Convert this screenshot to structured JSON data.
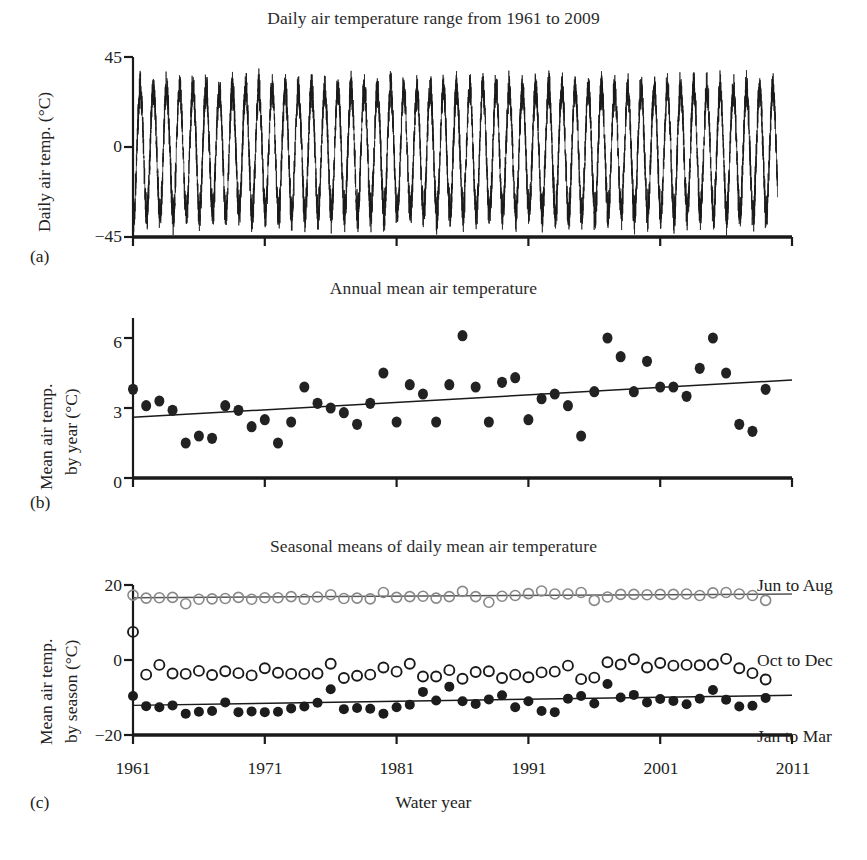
{
  "figure": {
    "panels": [
      {
        "letter": "(a)",
        "title": "Daily air temperature range from 1961 to 2009"
      },
      {
        "letter": "(b)",
        "title": "Annual mean air temperature"
      },
      {
        "letter": "(c)",
        "title": "Seasonal means of daily mean air temperature"
      }
    ],
    "xaxis_title": "Water year",
    "ink_color": "#1a1a1a"
  },
  "chart_data": [
    {
      "panel": "a",
      "type": "line",
      "title": "Daily air temperature range from 1961 to 2009",
      "xlabel": "",
      "ylabel": "Daily air temp. (°C)",
      "ylim": [
        -45,
        45
      ],
      "yticks": [
        45,
        0,
        -45
      ],
      "ytick_labels": [
        "45",
        "0",
        "−45"
      ],
      "xlim": [
        1961,
        2011
      ],
      "xticks": [
        1961,
        1971,
        1981,
        1991,
        2001,
        2011
      ],
      "grid": false,
      "legend": "none",
      "description": "Dense daily time series with strong annual sinusoidal cycle; summer peaks near +30 to +38 °C, winter troughs near −35 to −44 °C, around 49 annual cycles from 1961 to 2009.",
      "seasonal_cycle": {
        "mean": -1.0,
        "summer_peak_mean": 30,
        "summer_peak_max": 38,
        "winter_trough_mean": -32,
        "winter_trough_min": -44,
        "daily_noise_amplitude": 7,
        "cycles": 49
      }
    },
    {
      "panel": "b",
      "type": "scatter",
      "title": "Annual mean air temperature",
      "xlabel": "",
      "ylabel": "Mean air temp. by year (°C)",
      "ylim": [
        0,
        6.8
      ],
      "yticks": [
        6,
        3,
        0
      ],
      "ytick_labels": [
        "6",
        "3",
        "0"
      ],
      "xlim": [
        1961,
        2011
      ],
      "xticks": [
        1961,
        1971,
        1981,
        1991,
        2001,
        2011
      ],
      "grid": false,
      "legend": "none",
      "marker": "filled-circle",
      "x": [
        1961,
        1962,
        1963,
        1964,
        1965,
        1966,
        1967,
        1968,
        1969,
        1970,
        1971,
        1972,
        1973,
        1974,
        1975,
        1976,
        1977,
        1978,
        1979,
        1980,
        1981,
        1982,
        1983,
        1984,
        1985,
        1986,
        1987,
        1988,
        1989,
        1990,
        1991,
        1992,
        1993,
        1994,
        1995,
        1996,
        1997,
        1998,
        1999,
        2000,
        2001,
        2002,
        2003,
        2004,
        2005,
        2006,
        2007,
        2008,
        2009
      ],
      "values": [
        3.8,
        3.1,
        3.3,
        2.9,
        1.5,
        1.8,
        1.7,
        3.1,
        2.9,
        2.2,
        2.5,
        1.5,
        2.4,
        3.9,
        3.2,
        3.0,
        2.8,
        2.3,
        3.2,
        4.5,
        2.4,
        4.0,
        3.6,
        2.4,
        4.0,
        6.1,
        3.9,
        2.4,
        4.1,
        4.3,
        2.5,
        3.4,
        3.6,
        3.1,
        1.8,
        3.7,
        6.0,
        5.2,
        3.7,
        5.0,
        3.9,
        3.9,
        3.5,
        4.7,
        6.0,
        4.5,
        2.3,
        2.0,
        3.8
      ],
      "trend": {
        "type": "linear",
        "y_start": 2.6,
        "y_end": 4.2,
        "x_start": 1961,
        "x_end": 2011
      }
    },
    {
      "panel": "c",
      "type": "scatter",
      "title": "Seasonal means of daily mean air temperature",
      "xlabel": "Water year",
      "ylabel": "Mean air temp. by season (°C)",
      "ylim": [
        -20,
        22
      ],
      "yticks": [
        20,
        0,
        -20
      ],
      "ytick_labels": [
        "20",
        "0",
        "−20"
      ],
      "xlim": [
        1961,
        2011
      ],
      "xticks": [
        1961,
        1971,
        1981,
        1991,
        2001,
        2011
      ],
      "xtick_labels": [
        "1961",
        "1971",
        "1981",
        "1991",
        "2001",
        "2011"
      ],
      "grid": false,
      "legend": "right-inline",
      "x": [
        1961,
        1962,
        1963,
        1964,
        1965,
        1966,
        1967,
        1968,
        1969,
        1970,
        1971,
        1972,
        1973,
        1974,
        1975,
        1976,
        1977,
        1978,
        1979,
        1980,
        1981,
        1982,
        1983,
        1984,
        1985,
        1986,
        1987,
        1988,
        1989,
        1990,
        1991,
        1992,
        1993,
        1994,
        1995,
        1996,
        1997,
        1998,
        1999,
        2000,
        2001,
        2002,
        2003,
        2004,
        2005,
        2006,
        2007,
        2008,
        2009
      ],
      "series": [
        {
          "name": "Jun to Aug",
          "marker": "open-circle",
          "color": "#888888",
          "values": [
            17.3,
            16.5,
            16.6,
            16.7,
            15.0,
            16.2,
            16.3,
            16.4,
            16.7,
            16.2,
            16.6,
            16.6,
            16.9,
            16.2,
            16.8,
            17.4,
            16.4,
            16.5,
            16.3,
            18.0,
            16.7,
            16.9,
            17.0,
            16.5,
            16.9,
            18.3,
            16.9,
            15.4,
            17.0,
            17.2,
            17.7,
            18.4,
            17.6,
            17.6,
            18.0,
            15.9,
            16.8,
            17.5,
            17.5,
            17.4,
            17.5,
            17.5,
            17.6,
            17.2,
            17.9,
            18.0,
            17.6,
            17.2,
            15.9
          ],
          "trend": {
            "type": "linear",
            "y_start": 16.6,
            "y_end": 17.6,
            "x_start": 1961,
            "x_end": 2011
          }
        },
        {
          "name": "Oct to Dec",
          "marker": "open-circle",
          "color": "#1a1a1a",
          "values": [
            7.5,
            -3.9,
            -1.3,
            -3.6,
            -3.7,
            -2.9,
            -4.0,
            -3.0,
            -3.5,
            -4.1,
            -2.2,
            -3.4,
            -3.7,
            -3.7,
            -3.6,
            -1.0,
            -4.8,
            -4.2,
            -3.9,
            -2.0,
            -3.1,
            -1.0,
            -4.4,
            -4.4,
            -2.7,
            -5.0,
            -3.2,
            -3.0,
            -4.8,
            -3.9,
            -4.6,
            -3.3,
            -3.1,
            -1.5,
            -5.1,
            -4.7,
            -0.6,
            -1.2,
            0.2,
            -2.0,
            -0.8,
            -1.5,
            -1.3,
            -1.4,
            -1.2,
            0.3,
            -2.2,
            -3.5,
            -5.2
          ],
          "trend": null
        },
        {
          "name": "Jan to Mar",
          "marker": "filled-circle",
          "color": "#1a1a1a",
          "values": [
            -9.6,
            -12.3,
            -12.6,
            -12.1,
            -14.3,
            -13.8,
            -13.6,
            -11.3,
            -13.9,
            -13.7,
            -13.9,
            -13.8,
            -12.9,
            -12.4,
            -11.4,
            -7.8,
            -13.1,
            -12.8,
            -13.0,
            -14.3,
            -12.6,
            -11.9,
            -8.5,
            -10.8,
            -7.1,
            -11.0,
            -11.7,
            -10.5,
            -9.4,
            -12.6,
            -11.0,
            -13.6,
            -13.9,
            -10.3,
            -9.6,
            -11.6,
            -6.4,
            -10.0,
            -9.3,
            -11.3,
            -10.4,
            -10.9,
            -11.8,
            -10.3,
            -8.0,
            -10.6,
            -12.4,
            -12.2,
            -10.1
          ],
          "trend": {
            "type": "linear",
            "y_start": -12.1,
            "y_end": -9.4,
            "x_start": 1961,
            "x_end": 2011
          }
        }
      ]
    }
  ]
}
